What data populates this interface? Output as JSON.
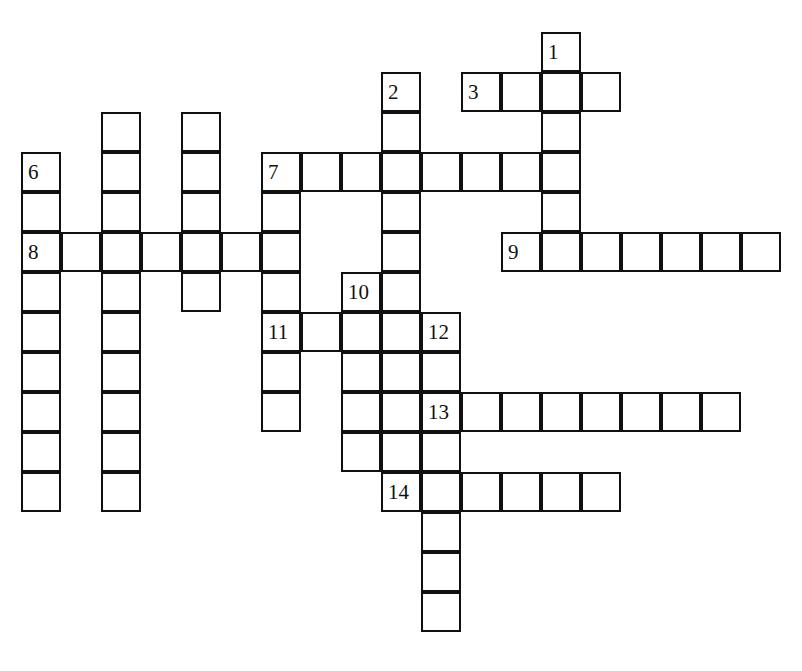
{
  "puzzle": {
    "title": "Crossword Grid",
    "kind": "crossword",
    "cell_size": 40,
    "border_color": "#101010",
    "cell_fill": "#ffffff",
    "page_background": "#ffffff",
    "number_font_size": 21,
    "grid_origin": {
      "x": 21,
      "y": 32
    },
    "entries": [
      {
        "number": "1",
        "direction": "down",
        "start": {
          "col": 13,
          "row": 0
        },
        "length": 6
      },
      {
        "number": "2",
        "direction": "down",
        "start": {
          "col": 9,
          "row": 1
        },
        "length": 5
      },
      {
        "number": "3",
        "direction": "across",
        "start": {
          "col": 11,
          "row": 1
        },
        "length": 4
      },
      {
        "number": "4",
        "direction": "down",
        "start": {
          "col": 2,
          "row": 2
        },
        "length": 9
      },
      {
        "number": "5",
        "direction": "down",
        "start": {
          "col": 4,
          "row": 2
        },
        "length": 5
      },
      {
        "number": "6",
        "direction": "down",
        "start": {
          "col": 0,
          "row": 3
        },
        "length": 9
      },
      {
        "number": "7",
        "direction": "across",
        "start": {
          "col": 6,
          "row": 3
        },
        "length": 8
      },
      {
        "number": "7d",
        "direction": "down",
        "start": {
          "col": 6,
          "row": 3
        },
        "length": 8
      },
      {
        "number": "8",
        "direction": "across",
        "start": {
          "col": 0,
          "row": 5
        },
        "length": 7
      },
      {
        "number": "9",
        "direction": "across",
        "start": {
          "col": 12,
          "row": 5
        },
        "length": 7
      },
      {
        "number": "10",
        "direction": "down",
        "start": {
          "col": 8,
          "row": 6
        },
        "length": 6
      },
      {
        "number": "11",
        "direction": "across",
        "start": {
          "col": 6,
          "row": 7
        },
        "length": 5
      },
      {
        "number": "12",
        "direction": "down",
        "start": {
          "col": 10,
          "row": 7
        },
        "length": 8
      },
      {
        "number": "13",
        "direction": "across",
        "start": {
          "col": 10,
          "row": 9
        },
        "length": 8
      },
      {
        "number": "14",
        "direction": "across",
        "start": {
          "col": 9,
          "row": 11
        },
        "length": 6
      }
    ],
    "labels": [
      {
        "text": "1",
        "col": 13,
        "row": 0
      },
      {
        "text": "2",
        "col": 9,
        "row": 1
      },
      {
        "text": "3",
        "col": 11,
        "row": 1
      },
      {
        "text": "6",
        "col": 0,
        "row": 3
      },
      {
        "text": "7",
        "col": 6,
        "row": 3
      },
      {
        "text": "8",
        "col": 0,
        "row": 5
      },
      {
        "text": "9",
        "col": 12,
        "row": 5
      },
      {
        "text": "10",
        "col": 8,
        "row": 6
      },
      {
        "text": "11",
        "col": 6,
        "row": 7
      },
      {
        "text": "12",
        "col": 10,
        "row": 7
      },
      {
        "text": "13",
        "col": 10,
        "row": 9
      },
      {
        "text": "14",
        "col": 9,
        "row": 11
      }
    ],
    "cells": [
      {
        "col": 13,
        "row": 0
      },
      {
        "col": 9,
        "row": 1
      },
      {
        "col": 11,
        "row": 1
      },
      {
        "col": 12,
        "row": 1
      },
      {
        "col": 13,
        "row": 1
      },
      {
        "col": 14,
        "row": 1
      },
      {
        "col": 2,
        "row": 2
      },
      {
        "col": 4,
        "row": 2
      },
      {
        "col": 9,
        "row": 2
      },
      {
        "col": 13,
        "row": 2
      },
      {
        "col": 0,
        "row": 3
      },
      {
        "col": 2,
        "row": 3
      },
      {
        "col": 4,
        "row": 3
      },
      {
        "col": 6,
        "row": 3
      },
      {
        "col": 7,
        "row": 3
      },
      {
        "col": 8,
        "row": 3
      },
      {
        "col": 9,
        "row": 3
      },
      {
        "col": 10,
        "row": 3
      },
      {
        "col": 11,
        "row": 3
      },
      {
        "col": 12,
        "row": 3
      },
      {
        "col": 13,
        "row": 3
      },
      {
        "col": 0,
        "row": 4
      },
      {
        "col": 2,
        "row": 4
      },
      {
        "col": 4,
        "row": 4
      },
      {
        "col": 6,
        "row": 4
      },
      {
        "col": 9,
        "row": 4
      },
      {
        "col": 13,
        "row": 4
      },
      {
        "col": 0,
        "row": 5
      },
      {
        "col": 1,
        "row": 5
      },
      {
        "col": 2,
        "row": 5
      },
      {
        "col": 3,
        "row": 5
      },
      {
        "col": 4,
        "row": 5
      },
      {
        "col": 5,
        "row": 5
      },
      {
        "col": 6,
        "row": 5
      },
      {
        "col": 9,
        "row": 5
      },
      {
        "col": 12,
        "row": 5
      },
      {
        "col": 13,
        "row": 5
      },
      {
        "col": 14,
        "row": 5
      },
      {
        "col": 15,
        "row": 5
      },
      {
        "col": 16,
        "row": 5
      },
      {
        "col": 17,
        "row": 5
      },
      {
        "col": 18,
        "row": 5
      },
      {
        "col": 0,
        "row": 6
      },
      {
        "col": 2,
        "row": 6
      },
      {
        "col": 4,
        "row": 6
      },
      {
        "col": 6,
        "row": 6
      },
      {
        "col": 8,
        "row": 6
      },
      {
        "col": 9,
        "row": 6
      },
      {
        "col": 0,
        "row": 7
      },
      {
        "col": 2,
        "row": 7
      },
      {
        "col": 6,
        "row": 7
      },
      {
        "col": 7,
        "row": 7
      },
      {
        "col": 8,
        "row": 7
      },
      {
        "col": 9,
        "row": 7
      },
      {
        "col": 10,
        "row": 7
      },
      {
        "col": 0,
        "row": 8
      },
      {
        "col": 2,
        "row": 8
      },
      {
        "col": 6,
        "row": 8
      },
      {
        "col": 8,
        "row": 8
      },
      {
        "col": 9,
        "row": 8
      },
      {
        "col": 10,
        "row": 8
      },
      {
        "col": 0,
        "row": 9
      },
      {
        "col": 2,
        "row": 9
      },
      {
        "col": 6,
        "row": 9
      },
      {
        "col": 8,
        "row": 9
      },
      {
        "col": 9,
        "row": 9
      },
      {
        "col": 10,
        "row": 9
      },
      {
        "col": 11,
        "row": 9
      },
      {
        "col": 12,
        "row": 9
      },
      {
        "col": 13,
        "row": 9
      },
      {
        "col": 14,
        "row": 9
      },
      {
        "col": 15,
        "row": 9
      },
      {
        "col": 16,
        "row": 9
      },
      {
        "col": 17,
        "row": 9
      },
      {
        "col": 0,
        "row": 10
      },
      {
        "col": 2,
        "row": 10
      },
      {
        "col": 8,
        "row": 10
      },
      {
        "col": 9,
        "row": 10
      },
      {
        "col": 10,
        "row": 10
      },
      {
        "col": 0,
        "row": 11
      },
      {
        "col": 2,
        "row": 11
      },
      {
        "col": 9,
        "row": 11
      },
      {
        "col": 10,
        "row": 11
      },
      {
        "col": 11,
        "row": 11
      },
      {
        "col": 12,
        "row": 11
      },
      {
        "col": 13,
        "row": 11
      },
      {
        "col": 14,
        "row": 11
      },
      {
        "col": 10,
        "row": 12
      },
      {
        "col": 10,
        "row": 13
      },
      {
        "col": 10,
        "row": 14
      }
    ]
  },
  "artifacts": {
    "scan_top_text": ""
  }
}
